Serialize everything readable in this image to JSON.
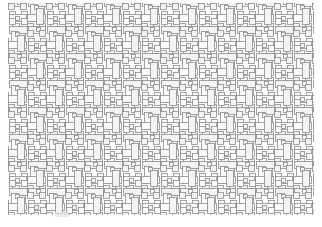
{
  "figure": {
    "width": 322,
    "height": 227,
    "background_color": "#ffffff"
  },
  "style": {
    "stroke_color": "#8d8d8d",
    "stroke_width": 0.8,
    "fill_color": "#fbfbfb",
    "fill_color_alt": "#f4f4f4",
    "artifact_color": "#e4e4e4"
  },
  "chart_data": {
    "type": "diagram",
    "pattern_name": "basket-weave pinwheel tessellation",
    "plot_area": {
      "x": 8,
      "y": 3,
      "width": 306,
      "height": 212
    },
    "tile": {
      "period_x": 38,
      "period_y": 27,
      "columns": 8,
      "rows": 8,
      "units": "pixels"
    },
    "shapes": [
      {
        "name": "long-horizontal-bar",
        "x": 1,
        "y": 10.5,
        "w": 17,
        "h": 7,
        "fill": "#fbfbfb"
      },
      {
        "name": "long-vertical-bar",
        "x": 21.5,
        "y": 1,
        "w": 7,
        "h": 17,
        "fill": "#fbfbfb"
      },
      {
        "name": "small-square-a",
        "x": 19,
        "y": 19.5,
        "w": 6,
        "h": 6,
        "fill": "#f4f4f4"
      },
      {
        "name": "small-square-b",
        "x": 31,
        "y": 19.5,
        "w": 6,
        "h": 6,
        "fill": "#f4f4f4"
      },
      {
        "name": "small-square-c",
        "x": 0,
        "y": 0,
        "w": 6,
        "h": 6,
        "fill": "#f4f4f4"
      },
      {
        "name": "small-square-d",
        "x": 12,
        "y": 0,
        "w": 6,
        "h": 6,
        "fill": "#f4f4f4"
      },
      {
        "name": "wide-plate",
        "x": 19,
        "y": 10.5,
        "w": 18,
        "h": 7,
        "fill": "#fbfbfb"
      },
      {
        "name": "tall-plate",
        "x": 3.5,
        "y": 19.5,
        "w": 7,
        "h": 16,
        "fill": "#fbfbfb"
      },
      {
        "name": "centre-square",
        "x": 25.5,
        "y": 1.5,
        "w": 4,
        "h": 4,
        "fill": "#f4f4f4"
      },
      {
        "name": "link-square",
        "x": 6.5,
        "y": 12.5,
        "w": 4,
        "h": 4,
        "fill": "#f4f4f4"
      }
    ],
    "legend": null,
    "grid": false,
    "xlabel": "",
    "ylabel": ""
  },
  "artifact": {
    "name": "scan-artifact",
    "visible": true
  }
}
